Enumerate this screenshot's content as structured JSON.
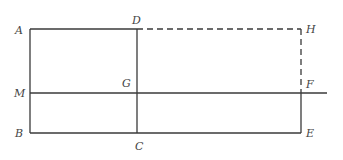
{
  "diagram": {
    "type": "geometric-figure",
    "colors": {
      "line": "#3a3a3a",
      "label": "#444444",
      "background": "#ffffff"
    },
    "points": {
      "A": {
        "label": "A",
        "x": 30,
        "y": 29
      },
      "D": {
        "label": "D",
        "x": 137,
        "y": 29
      },
      "H": {
        "label": "H",
        "x": 301,
        "y": 29
      },
      "M": {
        "label": "M",
        "x": 30,
        "y": 93
      },
      "G": {
        "label": "G",
        "x": 137,
        "y": 93
      },
      "F": {
        "label": "F",
        "x": 301,
        "y": 93
      },
      "B": {
        "label": "B",
        "x": 30,
        "y": 133
      },
      "C": {
        "label": "C",
        "x": 137,
        "y": 133
      },
      "E": {
        "label": "E",
        "x": 301,
        "y": 133
      }
    },
    "segments": {
      "solid": [
        "AD",
        "AB",
        "DC",
        "BE",
        "EF",
        "MF-extended"
      ],
      "dashed": [
        "DH",
        "HF"
      ]
    }
  }
}
